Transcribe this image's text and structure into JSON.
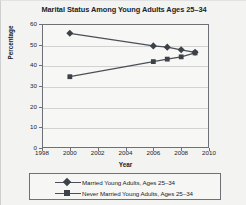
{
  "chart_data": {
    "type": "line",
    "title": "Marital Status Among Young Adults Ages 25–34",
    "xlabel": "Year",
    "ylabel": "Percentage",
    "xlim": [
      1998,
      2010
    ],
    "ylim": [
      0,
      60
    ],
    "xticks": [
      1998,
      2000,
      2002,
      2004,
      2006,
      2008,
      2010
    ],
    "yticks": [
      0,
      10,
      20,
      30,
      40,
      50,
      60
    ],
    "grid": true,
    "legend_position": "below",
    "line_color": "#4b4f57",
    "series": [
      {
        "name": "Married Young Adults, Ages 25–34",
        "marker": "diamond",
        "color": "#3d4148",
        "x": [
          2000,
          2006,
          2007,
          2008,
          2009
        ],
        "values": [
          55.5,
          49.4,
          48.8,
          47.5,
          46.3
        ]
      },
      {
        "name": "Never Married Young Adults, Ages 25–34",
        "marker": "square",
        "color": "#3d4148",
        "x": [
          2000,
          2006,
          2007,
          2008,
          2009
        ],
        "values": [
          34.5,
          41.8,
          43.0,
          44.1,
          46.0
        ]
      }
    ]
  },
  "legend": {
    "entries": [
      "Married Young Adults, Ages 25–34",
      "Never Married Young Adults, Ages 25–34"
    ]
  }
}
